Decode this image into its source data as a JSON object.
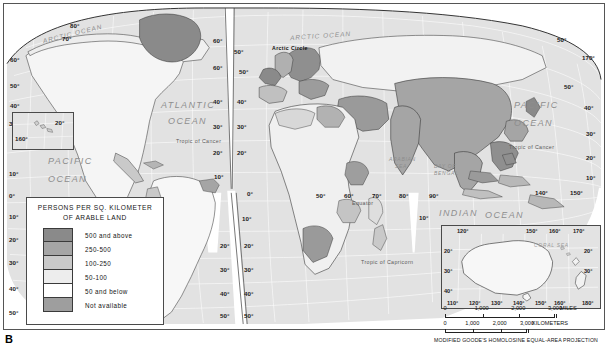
{
  "figure": {
    "label": "B",
    "projection_note": "MODIFIED GOODE'S HOMOLOSINE EQUAL-AREA PROJECTION"
  },
  "legend": {
    "title_line1": "PERSONS PER SQ. KILOMETER",
    "title_line2": "OF ARABLE LAND",
    "classes": [
      {
        "label": "500 and above",
        "color": "#8a8a8a"
      },
      {
        "label": "250-500",
        "color": "#a5a5a5"
      },
      {
        "label": "100-250",
        "color": "#c9c9c9"
      },
      {
        "label": "50-100",
        "color": "#ededed"
      },
      {
        "label": "50 and below",
        "color": "#ffffff"
      },
      {
        "label": "Not available",
        "color": "#9e9e9e"
      }
    ]
  },
  "ocean_labels": [
    {
      "name": "arctic-ocean-west",
      "text": "ARCTIC OCEAN",
      "x": 38,
      "y": 26,
      "size": "mid",
      "rot": -14
    },
    {
      "name": "arctic-ocean-east",
      "text": "ARCTIC OCEAN",
      "x": 286,
      "y": 28,
      "size": "mid",
      "rot": -4
    },
    {
      "name": "atlantic-ocean",
      "text": "ATLANTIC",
      "x": 157,
      "y": 96,
      "size": "big",
      "rot": 0
    },
    {
      "name": "atlantic-ocean-2",
      "text": "OCEAN",
      "x": 164,
      "y": 112,
      "size": "big",
      "rot": 0
    },
    {
      "name": "pacific-ocean-east",
      "text": "PACIFIC",
      "x": 510,
      "y": 96,
      "size": "big",
      "rot": 0
    },
    {
      "name": "pacific-ocean-east2",
      "text": "OCEAN",
      "x": 510,
      "y": 114,
      "size": "big",
      "rot": 0
    },
    {
      "name": "pacific-ocean-west",
      "text": "PACIFIC",
      "x": 44,
      "y": 152,
      "size": "big",
      "rot": 0
    },
    {
      "name": "pacific-ocean-west2",
      "text": "OCEAN",
      "x": 44,
      "y": 170,
      "size": "big",
      "rot": 0
    },
    {
      "name": "indian-ocean",
      "text": "INDIAN",
      "x": 435,
      "y": 204,
      "size": "big",
      "rot": 0
    },
    {
      "name": "indian-ocean-2",
      "text": "OCEAN",
      "x": 481,
      "y": 206,
      "size": "big",
      "rot": 0
    },
    {
      "name": "arabian-sea",
      "text": "ARABIAN",
      "x": 385,
      "y": 152,
      "size": "sml",
      "rot": 0
    },
    {
      "name": "arabian-sea-2",
      "text": "SEA",
      "x": 391,
      "y": 159,
      "size": "sml",
      "rot": 0
    },
    {
      "name": "bay-of-bengal",
      "text": "BAY OF",
      "x": 430,
      "y": 159,
      "size": "sml",
      "rot": 0
    },
    {
      "name": "bay-of-bengal-2",
      "text": "BENGAL",
      "x": 430,
      "y": 166,
      "size": "sml",
      "rot": 0
    },
    {
      "name": "coral-sea",
      "text": "CORAL SEA",
      "x": 539,
      "y": 237,
      "size": "sml",
      "rot": 0
    }
  ],
  "reference_lines": [
    {
      "name": "arctic-circle",
      "text": "Arctic Circle",
      "x": 268,
      "y": 41,
      "bold": true
    },
    {
      "name": "tropic-of-cancer-w",
      "text": "Tropic of Cancer",
      "x": 172,
      "y": 134,
      "bold": false
    },
    {
      "name": "tropic-of-cancer-e",
      "text": "Tropic of Cancer",
      "x": 505,
      "y": 140,
      "bold": false
    },
    {
      "name": "equator",
      "text": "Equator",
      "x": 348,
      "y": 196,
      "bold": false
    },
    {
      "name": "tropic-of-capricorn",
      "text": "Tropic of Capricorn",
      "x": 357,
      "y": 255,
      "bold": false
    }
  ],
  "graticule_labels": [
    {
      "t": "80°",
      "x": 66,
      "y": 18
    },
    {
      "t": "70°",
      "x": 58,
      "y": 31
    },
    {
      "t": "60°",
      "x": 6,
      "y": 52
    },
    {
      "t": "50°",
      "x": 6,
      "y": 78
    },
    {
      "t": "40°",
      "x": 6,
      "y": 98
    },
    {
      "t": "30°",
      "x": 5,
      "y": 116
    },
    {
      "t": "10°",
      "x": 5,
      "y": 166
    },
    {
      "t": "0°",
      "x": 5,
      "y": 188
    },
    {
      "t": "10°",
      "x": 5,
      "y": 209
    },
    {
      "t": "20°",
      "x": 5,
      "y": 232
    },
    {
      "t": "30°",
      "x": 5,
      "y": 255
    },
    {
      "t": "40°",
      "x": 5,
      "y": 281
    },
    {
      "t": "50°",
      "x": 5,
      "y": 305
    },
    {
      "t": "60°",
      "x": 209,
      "y": 33
    },
    {
      "t": "50°",
      "x": 230,
      "y": 44
    },
    {
      "t": "60°",
      "x": 209,
      "y": 60
    },
    {
      "t": "50°",
      "x": 235,
      "y": 64
    },
    {
      "t": "40°",
      "x": 209,
      "y": 94
    },
    {
      "t": "40°",
      "x": 233,
      "y": 94
    },
    {
      "t": "30°",
      "x": 209,
      "y": 119
    },
    {
      "t": "30°",
      "x": 233,
      "y": 119
    },
    {
      "t": "20°",
      "x": 209,
      "y": 145
    },
    {
      "t": "20°",
      "x": 233,
      "y": 145
    },
    {
      "t": "10°",
      "x": 210,
      "y": 169
    },
    {
      "t": "0°",
      "x": 243,
      "y": 186
    },
    {
      "t": "10°",
      "x": 238,
      "y": 211
    },
    {
      "t": "20°",
      "x": 240,
      "y": 238
    },
    {
      "t": "20°",
      "x": 216,
      "y": 238
    },
    {
      "t": "30°",
      "x": 240,
      "y": 262
    },
    {
      "t": "30°",
      "x": 216,
      "y": 262
    },
    {
      "t": "40°",
      "x": 240,
      "y": 286
    },
    {
      "t": "40°",
      "x": 216,
      "y": 286
    },
    {
      "t": "50°",
      "x": 240,
      "y": 308
    },
    {
      "t": "50°",
      "x": 216,
      "y": 308
    },
    {
      "t": "50°",
      "x": 312,
      "y": 188
    },
    {
      "t": "60°",
      "x": 340,
      "y": 188
    },
    {
      "t": "70°",
      "x": 368,
      "y": 188
    },
    {
      "t": "80°",
      "x": 395,
      "y": 188
    },
    {
      "t": "90°",
      "x": 425,
      "y": 188
    },
    {
      "t": "10°",
      "x": 415,
      "y": 210
    },
    {
      "t": "140°",
      "x": 531,
      "y": 185
    },
    {
      "t": "150°",
      "x": 566,
      "y": 185
    },
    {
      "t": "170°",
      "x": 578,
      "y": 50
    },
    {
      "t": "50°",
      "x": 560,
      "y": 79
    },
    {
      "t": "40°",
      "x": 580,
      "y": 100
    },
    {
      "t": "30°",
      "x": 582,
      "y": 126
    },
    {
      "t": "20°",
      "x": 582,
      "y": 150
    },
    {
      "t": "10°",
      "x": 582,
      "y": 170
    },
    {
      "t": "50°",
      "x": 553,
      "y": 32
    }
  ],
  "hawaii_inset": {
    "lon_label": "160°",
    "lat_label": "20°"
  },
  "australia_inset": {
    "top_lon": [
      "120°",
      "150°",
      "160°",
      "170°"
    ],
    "bottom_lon": [
      "110°",
      "120°",
      "130°",
      "140°",
      "150°",
      "160°",
      "180°"
    ],
    "left_lat": [
      "20°",
      "30°",
      "40°"
    ],
    "right_lat": [
      "20°",
      "30°"
    ],
    "sea_label": "CORAL SEA"
  },
  "scale_miles": {
    "ticks": [
      "0",
      "1,000",
      "2,000",
      "3,000"
    ],
    "unit": "MILES"
  },
  "scale_km": {
    "ticks": [
      "0",
      "1,000",
      "2,000",
      "3,000"
    ],
    "unit": "KILOMETERS"
  },
  "chart_data": {
    "type": "map",
    "title": "Persons per sq. kilometer of arable land",
    "projection": "Modified Goode's Homolosine Equal-Area",
    "classes": [
      {
        "label": "500 and above",
        "color": "#8a8a8a"
      },
      {
        "label": "250-500",
        "color": "#a5a5a5"
      },
      {
        "label": "100-250",
        "color": "#c9c9c9"
      },
      {
        "label": "50-100",
        "color": "#ededed"
      },
      {
        "label": "50 and below",
        "color": "#ffffff"
      },
      {
        "label": "Not available",
        "color": "#9e9e9e"
      }
    ]
  }
}
